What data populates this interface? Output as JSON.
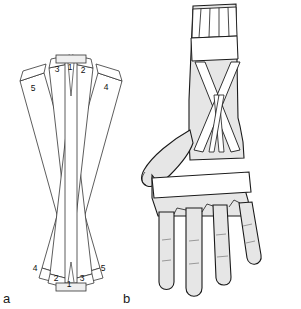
{
  "figure": {
    "caption_panels": [
      {
        "id": "a",
        "label": "a"
      },
      {
        "id": "b",
        "label": "b"
      }
    ],
    "colors": {
      "skin_fill": "#e6e6e6",
      "strap_fill": "#ffffff",
      "outline": "#1a1a1a",
      "thin_line": "#555555",
      "background": "#ffffff"
    }
  },
  "panel_a": {
    "label": "a",
    "description": "flat crossing bandage strip pattern",
    "top_strip_numbers": [
      "5",
      "3",
      "1",
      "2",
      "4"
    ],
    "bottom_strip_numbers": [
      "4",
      "2",
      "1",
      "3",
      "5"
    ],
    "strips": [
      {
        "number": "5",
        "top_label": "5",
        "bottom_label": "5"
      },
      {
        "number": "3",
        "top_label": "3",
        "bottom_label": "3"
      },
      {
        "number": "1",
        "top_label": "1",
        "bottom_label": "1"
      },
      {
        "number": "2",
        "top_label": "2",
        "bottom_label": "2"
      },
      {
        "number": "4",
        "top_label": "4",
        "bottom_label": "4"
      }
    ],
    "top_labels": [
      {
        "text": "5",
        "x": 33,
        "y": 91
      },
      {
        "text": "3",
        "x": 57,
        "y": 72
      },
      {
        "text": "1",
        "x": 70,
        "y": 70
      },
      {
        "text": "2",
        "x": 83,
        "y": 73
      },
      {
        "text": "4",
        "x": 106,
        "y": 90
      }
    ],
    "bottom_labels": [
      {
        "text": "4",
        "x": 35,
        "y": 271
      },
      {
        "text": "2",
        "x": 56,
        "y": 281
      },
      {
        "text": "1",
        "x": 69,
        "y": 286
      },
      {
        "text": "3",
        "x": 82,
        "y": 281
      },
      {
        "text": "5",
        "x": 103,
        "y": 271
      }
    ]
  },
  "panel_b": {
    "label": "b",
    "description": "bandage applied to hand and forearm",
    "fan_tab_count": 5,
    "finger_count": 4,
    "thumb": true,
    "wrist_band": true,
    "forearm_band": true,
    "crossing_straps": true
  }
}
